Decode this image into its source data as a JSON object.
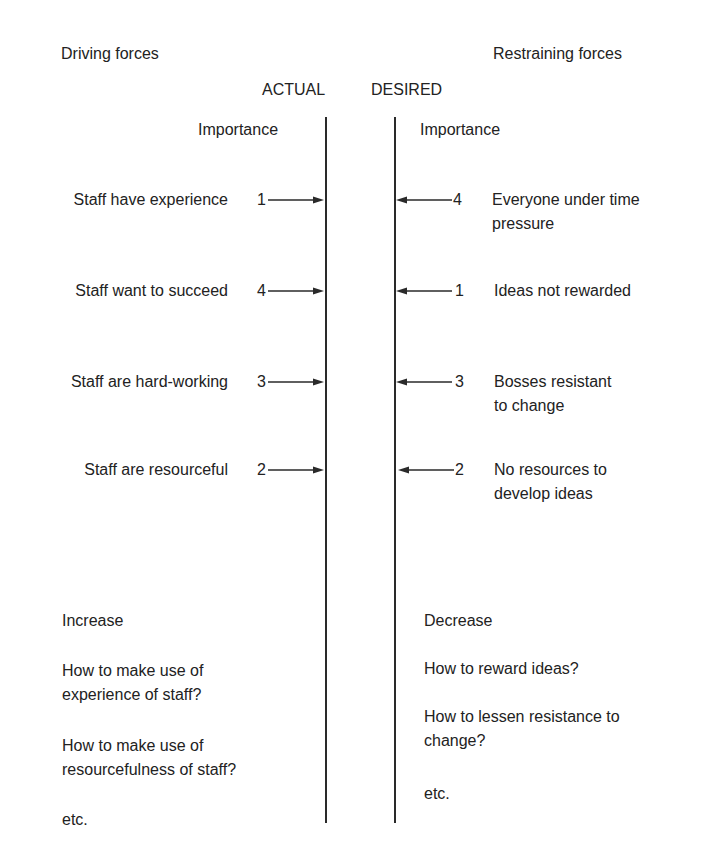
{
  "header": {
    "driving_title": "Driving forces",
    "restraining_title": "Restraining forces",
    "actual_label": "ACTUAL",
    "desired_label": "DESIRED",
    "importance_left": "Importance",
    "importance_right": "Importance"
  },
  "driving_forces": [
    {
      "label": "Staff have experience",
      "importance": "1"
    },
    {
      "label": "Staff want to succeed",
      "importance": "4"
    },
    {
      "label": "Staff are hard-working",
      "importance": "3"
    },
    {
      "label": "Staff are resourceful",
      "importance": "2"
    }
  ],
  "restraining_forces": [
    {
      "label_line1": "Everyone under time",
      "label_line2": "pressure",
      "importance": "4"
    },
    {
      "label_line1": "Ideas not rewarded",
      "label_line2": "",
      "importance": "1"
    },
    {
      "label_line1": "Bosses resistant",
      "label_line2": "to change",
      "importance": "3"
    },
    {
      "label_line1": "No resources to",
      "label_line2": "develop ideas",
      "importance": "2"
    }
  ],
  "increase": {
    "heading": "Increase",
    "items": [
      {
        "line1": "How to make use of",
        "line2": "experience of staff?"
      },
      {
        "line1": "How to make use of",
        "line2": "resourcefulness of staff?"
      }
    ],
    "etc": "etc."
  },
  "decrease": {
    "heading": "Decrease",
    "items": [
      {
        "line1": "How to reward ideas?",
        "line2": ""
      },
      {
        "line1": "How to lessen resistance to",
        "line2": "change?"
      }
    ],
    "etc": "etc."
  },
  "colors": {
    "text": "#222222",
    "line": "#2a2a2a",
    "background": "#ffffff"
  }
}
